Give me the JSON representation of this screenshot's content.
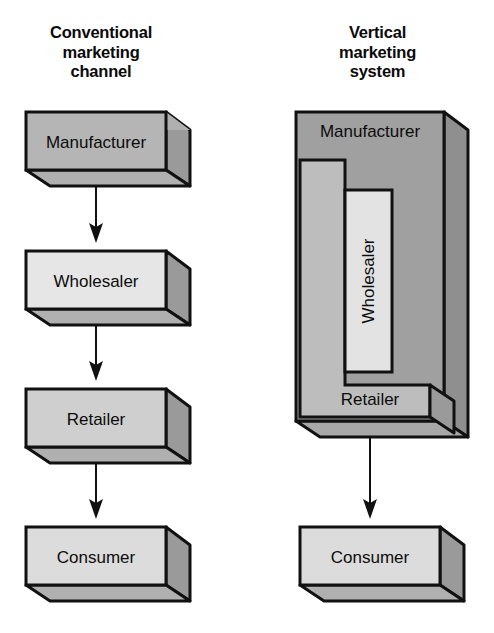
{
  "figure": {
    "type": "diagram",
    "columns": [
      {
        "id": "conventional",
        "title": "Conventional\nmarketing\nchannel",
        "title_lines": [
          "Conventional",
          "marketing",
          "channel"
        ],
        "structure": "linear-chain",
        "nodes": [
          {
            "id": "mfr-left",
            "label": "Manufacturer",
            "fill": "#b5b5b5"
          },
          {
            "id": "whs-left",
            "label": "Wholesaler",
            "fill": "#e6e6e6"
          },
          {
            "id": "ret-left",
            "label": "Retailer",
            "fill": "#cfcfcf"
          },
          {
            "id": "con-left",
            "label": "Consumer",
            "fill": "#dcdcdc"
          }
        ],
        "connectors": [
          {
            "from": "mfr-left",
            "to": "whs-left",
            "kind": "arrow-down"
          },
          {
            "from": "whs-left",
            "to": "ret-left",
            "kind": "arrow-down"
          },
          {
            "from": "ret-left",
            "to": "con-left",
            "kind": "arrow-down"
          }
        ]
      },
      {
        "id": "vertical",
        "title": "Vertical\nmarketing\nsystem",
        "title_lines": [
          "Vertical",
          "marketing",
          "system"
        ],
        "structure": "nested-integrated",
        "nodes": [
          {
            "id": "mfr-right",
            "label": "Manufacturer",
            "fill": "#a0a0a0",
            "role": "outer-container"
          },
          {
            "id": "ret-right",
            "label": "Retailer",
            "fill": "#bdbdbd",
            "role": "middle-container"
          },
          {
            "id": "whs-right",
            "label": "Wholesaler",
            "fill": "#e3e3e3",
            "role": "inner-container",
            "orientation": "vertical-text"
          },
          {
            "id": "con-right",
            "label": "Consumer",
            "fill": "#dcdcdc",
            "role": "separate-box"
          }
        ],
        "connectors": [
          {
            "from": "ret-right",
            "to": "con-right",
            "kind": "arrow-down"
          }
        ]
      }
    ],
    "palette": {
      "outline": "#111111",
      "background": "#ffffff",
      "text": "#0c0c0c",
      "fill_dark": "#a0a0a0",
      "fill_medium": "#bdbdbd",
      "fill_light": "#e3e3e3",
      "fill_top_face": "#c8c8c8",
      "fill_side_face": "#9a9a9a"
    }
  }
}
